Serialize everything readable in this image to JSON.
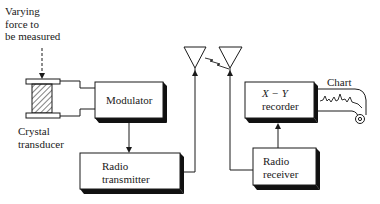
{
  "diagram": {
    "type": "block-diagram",
    "title": "",
    "labels": {
      "force_line1": "Varying",
      "force_line2": "force to",
      "force_line3": "be measured",
      "transducer_line1": "Crystal",
      "transducer_line2": "transducer",
      "chart": "Chart"
    },
    "blocks": {
      "modulator": {
        "label": "Modulator"
      },
      "transmitter": {
        "line1": "Radio",
        "line2": "transmitter"
      },
      "recorder": {
        "line1": "X − Y",
        "line2": "recorder"
      },
      "receiver": {
        "line1": "Radio",
        "line2": "receiver"
      }
    },
    "flow": [
      "Varying force to be measured -> Crystal transducer",
      "Crystal transducer -> Modulator",
      "Modulator -> Radio transmitter",
      "Radio transmitter -> Transmit antenna",
      "Transmit antenna ~> Receive antenna (wireless link)",
      "Receive antenna -> Radio receiver",
      "Radio receiver -> X-Y recorder",
      "X-Y recorder -> Chart"
    ],
    "colors": {
      "line": "#1a1a1a",
      "shadow": "#111111",
      "background": "#ffffff"
    }
  }
}
